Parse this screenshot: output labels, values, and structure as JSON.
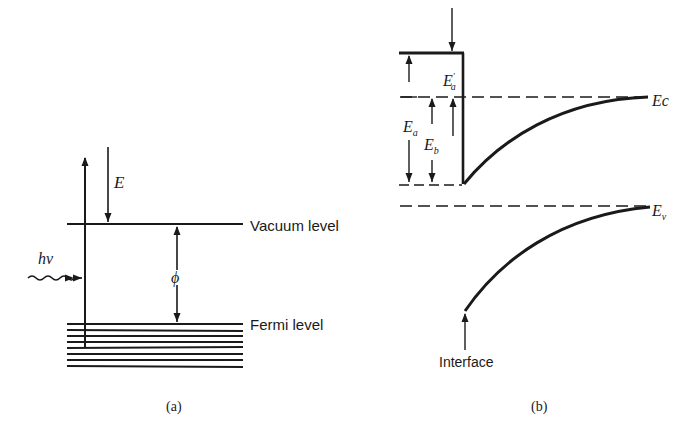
{
  "panel_a": {
    "caption": "(a)",
    "labels": {
      "energy": "E",
      "photon": "hν",
      "work_function": "ϕ",
      "vacuum_level": "Vacuum level",
      "fermi_level": "Fermi level"
    }
  },
  "panel_b": {
    "caption": "(b)",
    "labels": {
      "ea_prime": "E′a",
      "ea": "Ea",
      "eb": "Eb",
      "ec": "Ec",
      "ev": "Ev",
      "interface": "Interface"
    }
  },
  "colors": {
    "ink": "#1a1a1a",
    "background": "#ffffff"
  }
}
